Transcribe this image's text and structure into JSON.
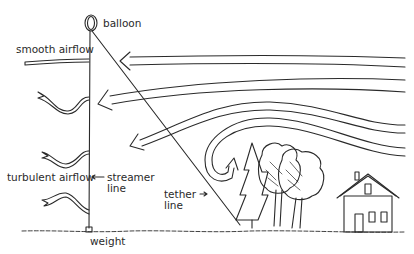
{
  "labels": {
    "balloon": "balloon",
    "smooth_airflow": "smooth airflow",
    "turbulent_airflow": "turbulent airflow",
    "streamer_line_1": "streamer",
    "streamer_line_2": "line",
    "tether_line_1": "tether",
    "tether_line_2": "line",
    "weight": "weight"
  },
  "colors": {
    "ink": "#2a2a2a",
    "background": "#ffffff"
  }
}
